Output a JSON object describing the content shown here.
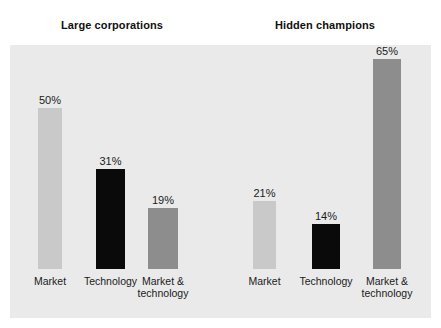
{
  "figure": {
    "background": "#ffffff",
    "panel_color": "#eaeaea"
  },
  "groups": [
    {
      "title": "Large corporations",
      "bars": [
        {
          "category": "Market",
          "value": 50,
          "label": "50%",
          "color": "#c9c9c9"
        },
        {
          "category": "Technology",
          "value": 31,
          "label": "31%",
          "color": "#0a0a0a"
        },
        {
          "category": "Market &\ntechnology",
          "value": 19,
          "label": "19%",
          "color": "#8d8d8d"
        }
      ]
    },
    {
      "title": "Hidden champions",
      "bars": [
        {
          "category": "Market",
          "value": 21,
          "label": "21%",
          "color": "#c9c9c9"
        },
        {
          "category": "Technology",
          "value": 14,
          "label": "14%",
          "color": "#0a0a0a"
        },
        {
          "category": "Market &\ntechnology",
          "value": 65,
          "label": "65%",
          "color": "#8d8d8d"
        }
      ]
    }
  ],
  "chart_data": {
    "type": "bar",
    "title": "",
    "xlabel": "",
    "ylabel": "",
    "ylim": [
      0,
      70
    ],
    "grid": false,
    "legend": false,
    "categories": [
      "Market",
      "Technology",
      "Market & technology"
    ],
    "series": [
      {
        "name": "Large corporations",
        "values": [
          50,
          31,
          19
        ]
      },
      {
        "name": "Hidden champions",
        "values": [
          21,
          14,
          65
        ]
      }
    ],
    "value_labels": [
      [
        "50%",
        "31%",
        "19%"
      ],
      [
        "21%",
        "14%",
        "65%"
      ]
    ],
    "colors": [
      "#c9c9c9",
      "#0a0a0a",
      "#8d8d8d"
    ],
    "units": "percent"
  }
}
